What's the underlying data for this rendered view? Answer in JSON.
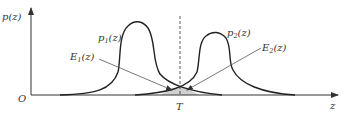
{
  "diagram": {
    "type": "overlapping-probability-densities",
    "axes": {
      "y_label": "p(z)",
      "x_label": "z",
      "origin_label": "O"
    },
    "threshold": {
      "label": "T"
    },
    "curves": [
      {
        "id": "p1",
        "label_main": "p",
        "label_sub": "1",
        "label_arg": "(z)"
      },
      {
        "id": "p2",
        "label_main": "p",
        "label_sub": "2",
        "label_arg": "(z)"
      }
    ],
    "error_regions": [
      {
        "id": "E1",
        "label_main": "E",
        "label_sub": "1",
        "label_arg": "(z)"
      },
      {
        "id": "E2",
        "label_main": "E",
        "label_sub": "2",
        "label_arg": "(z)"
      }
    ],
    "colors": {
      "curve": "#222222",
      "axis": "#333333",
      "pointer": "#555555",
      "shade": "#cccccc"
    }
  }
}
